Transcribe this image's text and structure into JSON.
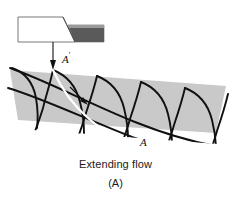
{
  "figure": {
    "caption_main": "Extending flow",
    "caption_sub": "(A)",
    "labels": {
      "inlet": "A",
      "inlet_prime_mark": "′",
      "outlet": "A"
    },
    "colors": {
      "band_fill": "#c9c9c9",
      "tool_dark": "#5a5a5a",
      "tool_light": "#ffffff",
      "line_black": "#111111",
      "streamline_white": "#ffffff",
      "background": "#ffffff"
    },
    "elements": {
      "tool_name": "forming-tool",
      "inlet_arrow_name": "inlet-arrow",
      "flow_arrow_name": "flow-direction-arrow",
      "band_name": "deformation-zone-band",
      "grid_name": "slip-line-field",
      "streamline_name": "white-streamline"
    }
  }
}
